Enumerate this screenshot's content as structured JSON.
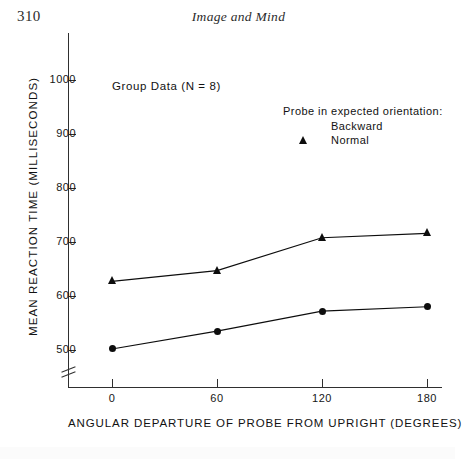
{
  "page": {
    "number": "310",
    "running_head": "Image and Mind"
  },
  "chart_data": {
    "type": "line",
    "title": "",
    "annotation": "Group Data (N = 8)",
    "xlabel": "ANGULAR DEPARTURE OF PROBE FROM UPRIGHT (DEGREES)",
    "ylabel": "MEAN REACTION TIME (MILLISECONDS)",
    "x": [
      0,
      60,
      120,
      180
    ],
    "x_tick_labels": [
      "0",
      "60",
      "120",
      "180"
    ],
    "y_tick_labels": [
      "500",
      "600",
      "700",
      "800",
      "900",
      "1000"
    ],
    "y_ticks": [
      500,
      600,
      700,
      800,
      900,
      1000
    ],
    "ylim": [
      480,
      1010
    ],
    "xlim": [
      -20,
      200
    ],
    "y_axis_break": true,
    "x_axis_break": false,
    "grid": false,
    "legend_position": "upper-right",
    "legend_title": "Probe in expected orientation:",
    "series": [
      {
        "name": "Backward",
        "marker": "triangle",
        "color": "#0d0d0d",
        "values": [
          627,
          647,
          708,
          716
        ]
      },
      {
        "name": "Normal",
        "marker": "circle",
        "color": "#0d0d0d",
        "values": [
          502,
          535,
          572,
          580
        ]
      }
    ]
  }
}
